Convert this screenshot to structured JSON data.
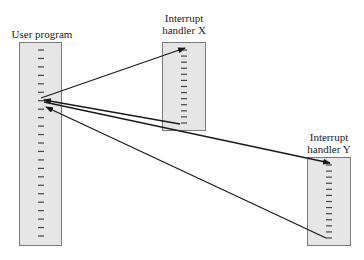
{
  "diagram": {
    "blocks": [
      {
        "id": "user",
        "label": "User program",
        "ticks": 23
      },
      {
        "id": "x",
        "label_line1": "Interrupt",
        "label_line2": "handler X",
        "ticks": 13
      },
      {
        "id": "y",
        "label_line1": "Interrupt",
        "label_line2": "handler Y",
        "ticks": 13
      }
    ],
    "arrows": [
      {
        "from": "user",
        "to": "x",
        "meaning": "transfer to handler X"
      },
      {
        "from": "x",
        "to": "user",
        "meaning": "return from handler X"
      },
      {
        "from": "user",
        "to": "y",
        "meaning": "transfer to handler Y"
      },
      {
        "from": "y",
        "to": "user",
        "meaning": "return from handler Y"
      }
    ],
    "colors": {
      "box_fill": "#e6e6e6",
      "box_border": "#7a7a7a",
      "line": "#1a1a1a",
      "tick": "#444444"
    }
  }
}
